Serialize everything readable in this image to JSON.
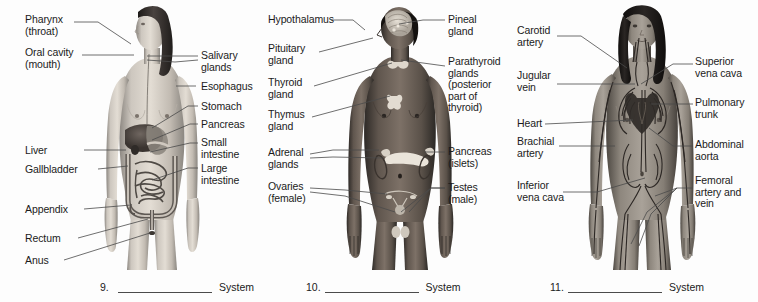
{
  "page": {
    "background_color": "#fdfdfd",
    "text_color": "#1b1b1b",
    "leader_line_color": "#4a4a4a"
  },
  "panels": [
    {
      "id": "digestive",
      "figure_name": "female-figure-digestive-system",
      "figure_description": "Grayscale anterior view of a female human body with digestive organs overlaid",
      "answer": {
        "number": "9.",
        "blank": "",
        "word": "System"
      },
      "labels_left": [
        {
          "name": "label-pharynx",
          "text": "Pharynx\n(throat)",
          "x": 25,
          "y": 14
        },
        {
          "name": "label-oral-cavity",
          "text": "Oral cavity\n(mouth)",
          "x": 25,
          "y": 47
        },
        {
          "name": "label-liver",
          "text": "Liver",
          "x": 25,
          "y": 146
        },
        {
          "name": "label-gallbladder",
          "text": "Gallbladder",
          "x": 25,
          "y": 165
        },
        {
          "name": "label-appendix",
          "text": "Appendix",
          "x": 25,
          "y": 205
        },
        {
          "name": "label-rectum",
          "text": "Rectum",
          "x": 25,
          "y": 234
        },
        {
          "name": "label-anus",
          "text": "Anus",
          "x": 25,
          "y": 256
        }
      ],
      "labels_right": [
        {
          "name": "label-salivary-glands",
          "text": "Salivary\nglands",
          "x": 201,
          "y": 50
        },
        {
          "name": "label-esophagus",
          "text": "Esophagus",
          "x": 201,
          "y": 83
        },
        {
          "name": "label-stomach",
          "text": "Stomach",
          "x": 201,
          "y": 102
        },
        {
          "name": "label-pancreas",
          "text": "Pancreas",
          "x": 201,
          "y": 121
        },
        {
          "name": "label-small-intestine",
          "text": "Small\nintestine",
          "x": 201,
          "y": 138
        },
        {
          "name": "label-large-intestine",
          "text": "Large\nintestine",
          "x": 201,
          "y": 164
        }
      ]
    },
    {
      "id": "endocrine",
      "figure_name": "male-figure-endocrine-system",
      "figure_description": "Grayscale anterior view of a male human body with endocrine glands overlaid",
      "answer": {
        "number": "10.",
        "blank": "",
        "word": "System"
      },
      "labels_left": [
        {
          "name": "label-hypothalamus",
          "text": "Hypothalamus",
          "x": 15,
          "y": 14
        },
        {
          "name": "label-pituitary-gland",
          "text": "Pituitary\ngland",
          "x": 15,
          "y": 44
        },
        {
          "name": "label-thyroid-gland",
          "text": "Thyroid\ngland",
          "x": 15,
          "y": 78
        },
        {
          "name": "label-thymus-gland",
          "text": "Thymus\ngland",
          "x": 15,
          "y": 110
        },
        {
          "name": "label-adrenal-glands",
          "text": "Adrenal\nglands",
          "x": 15,
          "y": 148
        },
        {
          "name": "label-ovaries",
          "text": "Ovaries\n(female)",
          "x": 15,
          "y": 181
        }
      ],
      "labels_right": [
        {
          "name": "label-pineal-gland",
          "text": "Pineal\ngland",
          "x": 195,
          "y": 14
        },
        {
          "name": "label-parathyroid-glands",
          "text": "Parathyroid\nglands\n(posterior\npart of\nthyroid)",
          "x": 195,
          "y": 57
        },
        {
          "name": "label-pancreas-islets",
          "text": "Pancreas\n(islets)",
          "x": 195,
          "y": 148
        },
        {
          "name": "label-testes",
          "text": "Testes\n(male)",
          "x": 195,
          "y": 181
        }
      ]
    },
    {
      "id": "circulatory",
      "figure_name": "female-figure-circulatory-system",
      "figure_description": "Grayscale anterior view of a female human body with blood vessels and heart overlaid",
      "answer": {
        "number": "11.",
        "blank": "",
        "word": "System"
      },
      "labels_left": [
        {
          "name": "label-carotid-artery",
          "text": "Carotid\nartery",
          "x": 12,
          "y": 26
        },
        {
          "name": "label-jugular-vein",
          "text": "Jugular\nvein",
          "x": 12,
          "y": 71
        },
        {
          "name": "label-heart",
          "text": "Heart",
          "x": 12,
          "y": 119
        },
        {
          "name": "label-brachial-artery",
          "text": "Brachial\nartery",
          "x": 12,
          "y": 138
        },
        {
          "name": "label-inferior-vena-cava",
          "text": "Inferior\nvena cava",
          "x": 12,
          "y": 181
        }
      ],
      "labels_right": [
        {
          "name": "label-superior-vena-cava",
          "text": "Superior\nvena cava",
          "x": 190,
          "y": 57
        },
        {
          "name": "label-pulmonary-trunk",
          "text": "Pulmonary\ntrunk",
          "x": 190,
          "y": 98
        },
        {
          "name": "label-abdominal-aorta",
          "text": "Abdominal\naorta",
          "x": 190,
          "y": 140
        },
        {
          "name": "label-femoral-artery-vein",
          "text": "Femoral\nartery and\nvein",
          "x": 190,
          "y": 176
        }
      ]
    }
  ]
}
